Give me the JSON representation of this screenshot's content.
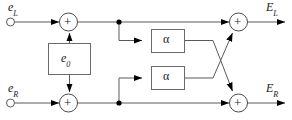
{
  "figure": {
    "type": "block-diagram",
    "canvas": {
      "width": 292,
      "height": 120,
      "background": "#ffffff"
    },
    "line_color": "#4d4d4d",
    "arrow_color": "#000000",
    "text_color": "#1a1a1a"
  },
  "labels": {
    "input_left": {
      "base": "e",
      "sub": "L"
    },
    "input_right": {
      "base": "e",
      "sub": "R"
    },
    "output_left": {
      "base": "E",
      "sub": "L"
    },
    "output_right": {
      "base": "E",
      "sub": "R"
    },
    "center_block": {
      "base": "e",
      "sub": "0"
    },
    "gain_top": "α",
    "gain_bottom": "α",
    "adder_symbol": "+"
  },
  "nodes": {
    "input_terminal_left": {
      "x": 10,
      "y": 22,
      "shape": "open-circle"
    },
    "input_terminal_right": {
      "x": 10,
      "y": 103,
      "shape": "open-circle"
    },
    "adder_top_left": {
      "x": 68,
      "y": 22,
      "r": 9
    },
    "adder_bottom_left": {
      "x": 68,
      "y": 103,
      "r": 9
    },
    "adder_top_right": {
      "x": 238,
      "y": 22,
      "r": 9
    },
    "adder_bottom_right": {
      "x": 238,
      "y": 103,
      "r": 9
    },
    "junction_top": {
      "x": 119,
      "y": 22,
      "shape": "filled-dot"
    },
    "junction_bottom": {
      "x": 119,
      "y": 103,
      "shape": "filled-dot"
    },
    "block_center": {
      "x": 48,
      "y": 43,
      "w": 43,
      "h": 32
    },
    "block_gain_top": {
      "x": 151,
      "y": 29,
      "w": 33,
      "h": 23
    },
    "block_gain_bottom": {
      "x": 151,
      "y": 66,
      "w": 33,
      "h": 24
    }
  },
  "edges": [
    {
      "name": "left-input-to-adder",
      "from": "input_terminal_left",
      "to": "adder_top_left"
    },
    {
      "name": "right-input-to-adder",
      "from": "input_terminal_right",
      "to": "adder_bottom_left"
    },
    {
      "name": "center-block-up",
      "from": "block_center",
      "to": "adder_top_left"
    },
    {
      "name": "center-block-down",
      "from": "block_center",
      "to": "adder_bottom_left"
    },
    {
      "name": "top-rail",
      "from": "adder_top_left",
      "to": "adder_top_right"
    },
    {
      "name": "bottom-rail",
      "from": "adder_bottom_left",
      "to": "adder_bottom_right"
    },
    {
      "name": "tap-top-to-gain-top",
      "from": "junction_top",
      "to": "block_gain_top"
    },
    {
      "name": "tap-bottom-to-gain-bottom",
      "from": "junction_bottom",
      "to": "block_gain_bottom"
    },
    {
      "name": "gain-top-cross-to-bottom-adder",
      "from": "block_gain_top",
      "to": "adder_bottom_right"
    },
    {
      "name": "gain-bottom-cross-to-top-adder",
      "from": "block_gain_bottom",
      "to": "adder_top_right"
    },
    {
      "name": "top-adder-to-output",
      "from": "adder_top_right",
      "to": "output_left"
    },
    {
      "name": "bottom-adder-to-output",
      "from": "adder_bottom_right",
      "to": "output_right"
    }
  ]
}
